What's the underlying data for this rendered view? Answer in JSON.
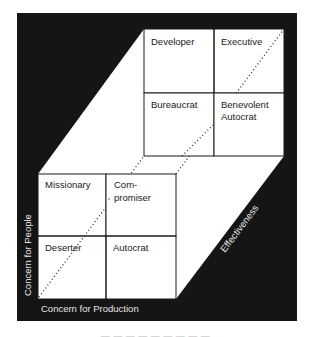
{
  "diagram": {
    "colors": {
      "frame": "#151515",
      "cell_fill": "#ffffff",
      "cell_stroke": "#1a1a1a",
      "dots": "#2a2a2a",
      "axis_text": "#e6e6e6"
    },
    "back_grid": {
      "cells": [
        {
          "label_lines": [
            "Developer"
          ]
        },
        {
          "label_lines": [
            "Executive"
          ]
        },
        {
          "label_lines": [
            "Bureaucrat"
          ]
        },
        {
          "label_lines": [
            "Benevolent",
            "Autocrat"
          ]
        }
      ]
    },
    "front_grid": {
      "cells": [
        {
          "label_lines": [
            "Missionary"
          ]
        },
        {
          "label_lines": [
            "Com-",
            "promiser"
          ]
        },
        {
          "label_lines": [
            "Deserter"
          ]
        },
        {
          "label_lines": [
            "Autocrat"
          ]
        }
      ]
    },
    "axes": {
      "vertical": "Concern for People",
      "horizontal": "Concern for Production",
      "diagonal": "Effectiveness"
    },
    "caption": "— — — — — — — — —"
  }
}
